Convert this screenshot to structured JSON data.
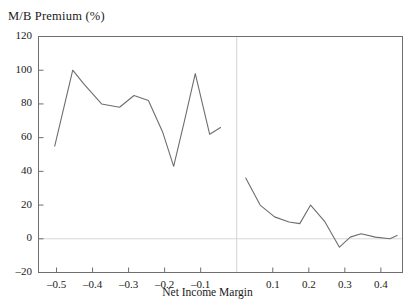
{
  "chart_data": {
    "type": "line",
    "title": "M/B Premium (%)",
    "xlabel": "Net Income Margin",
    "ylabel": "M/B Premium (%)",
    "xlim": [
      -0.55,
      0.46
    ],
    "ylim": [
      -20,
      120
    ],
    "grid": false,
    "legend": "none",
    "xticks": [
      -0.5,
      -0.4,
      -0.3,
      -0.2,
      -0.1,
      0.1,
      0.2,
      0.3,
      0.4
    ],
    "xtick_labels": [
      "–0.5",
      "–0.4",
      "–0.3",
      "–0.2",
      "–0.1",
      "0.1",
      "0.2",
      "0.3",
      "0.4"
    ],
    "yticks": [
      -20,
      0,
      20,
      40,
      60,
      80,
      100,
      120
    ],
    "ytick_labels": [
      "–20",
      "0",
      "20",
      "40",
      "60",
      "80",
      "100",
      "120"
    ],
    "zero_vline_x": 0,
    "zero_hline_y": 0,
    "series": [
      {
        "name": "Negative margin firms",
        "color": "#6e6e6e",
        "x": [
          -0.505,
          -0.455,
          -0.425,
          -0.375,
          -0.325,
          -0.285,
          -0.245,
          -0.205,
          -0.175,
          -0.145,
          -0.115,
          -0.075,
          -0.045
        ],
        "values": [
          55,
          100,
          92,
          80,
          78,
          85,
          82,
          63,
          43,
          70,
          98,
          62,
          66
        ]
      },
      {
        "name": "Positive margin firms",
        "color": "#6e6e6e",
        "x": [
          0.025,
          0.065,
          0.105,
          0.145,
          0.175,
          0.205,
          0.245,
          0.285,
          0.315,
          0.345,
          0.385,
          0.425,
          0.445
        ],
        "values": [
          36,
          20,
          13,
          10,
          9,
          20,
          10,
          -5,
          1,
          3,
          1,
          0,
          2
        ]
      }
    ]
  }
}
